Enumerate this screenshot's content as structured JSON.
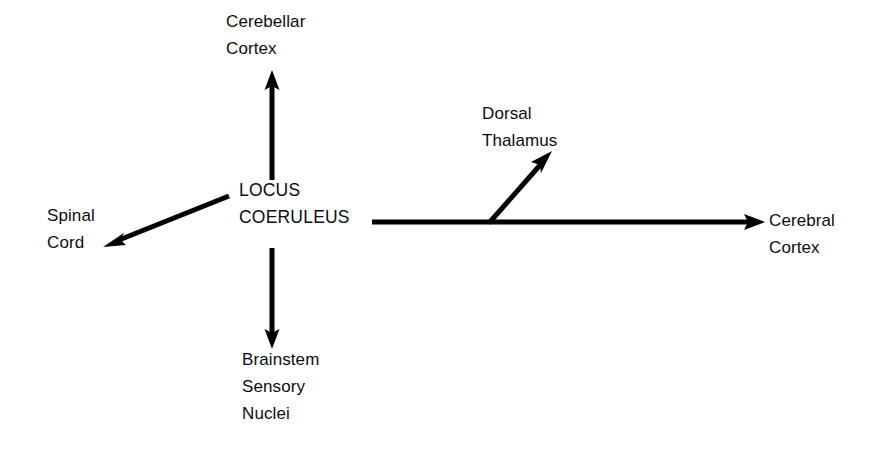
{
  "diagram": {
    "background_color": "#ffffff",
    "stroke_color": "#000000",
    "text_color": "#0d0d0d",
    "center": {
      "id": "locus-coeruleus",
      "line1": "LOCUS",
      "line2": "COERULEUS"
    },
    "nodes": [
      {
        "id": "cerebellar-cortex",
        "line1": "Cerebellar",
        "line2": "Cortex"
      },
      {
        "id": "dorsal-thalamus",
        "line1": "Dorsal",
        "line2": "Thalamus"
      },
      {
        "id": "spinal-cord",
        "line1": "Spinal",
        "line2": "Cord"
      },
      {
        "id": "cerebral-cortex",
        "line1": "Cerebral",
        "line2": "Cortex"
      },
      {
        "id": "brainstem-sensory-nuclei",
        "line1": "Brainstem",
        "line2": "Sensory",
        "line3": "Nuclei"
      }
    ],
    "arrows": [
      {
        "id": "arrow-to-cerebellar-cortex",
        "from": "locus-coeruleus",
        "to": "cerebellar-cortex",
        "direction": "up"
      },
      {
        "id": "arrow-to-brainstem-sensory-nuclei",
        "from": "locus-coeruleus",
        "to": "brainstem-sensory-nuclei",
        "direction": "down"
      },
      {
        "id": "arrow-to-spinal-cord",
        "from": "locus-coeruleus",
        "to": "spinal-cord",
        "direction": "down-left"
      },
      {
        "id": "arrow-to-cerebral-cortex",
        "from": "locus-coeruleus",
        "to": "cerebral-cortex",
        "direction": "right"
      },
      {
        "id": "arrow-to-dorsal-thalamus",
        "from": "arrow-to-cerebral-cortex",
        "to": "dorsal-thalamus",
        "direction": "up-right"
      }
    ]
  }
}
